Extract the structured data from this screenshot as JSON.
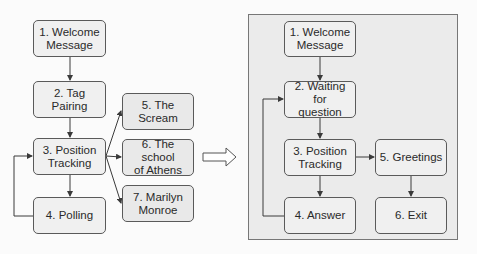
{
  "left_diagram": {
    "nodes": [
      {
        "id": "1",
        "label": "1. Welcome\nMessage"
      },
      {
        "id": "2",
        "label": "2. Tag Pairing"
      },
      {
        "id": "3",
        "label": "3. Position\nTracking"
      },
      {
        "id": "4",
        "label": "4. Polling"
      },
      {
        "id": "5",
        "label": "5. The\nScream"
      },
      {
        "id": "6",
        "label": "6. The school\nof Athens"
      },
      {
        "id": "7",
        "label": "7. Marilyn\nMonroe"
      }
    ],
    "edges": [
      {
        "from": "1",
        "to": "2"
      },
      {
        "from": "2",
        "to": "3"
      },
      {
        "from": "3",
        "to": "4"
      },
      {
        "from": "4",
        "to": "3"
      },
      {
        "from": "3",
        "to": "5"
      },
      {
        "from": "3",
        "to": "6"
      },
      {
        "from": "3",
        "to": "7"
      }
    ]
  },
  "transition_arrow": "hollow-right-arrow",
  "right_diagram": {
    "nodes": [
      {
        "id": "1",
        "label": "1. Welcome\nMessage"
      },
      {
        "id": "2",
        "label": "2. Waiting for\nquestion"
      },
      {
        "id": "3",
        "label": "3. Position\nTracking"
      },
      {
        "id": "4",
        "label": "4. Answer"
      },
      {
        "id": "5",
        "label": "5. Greetings"
      },
      {
        "id": "6",
        "label": "6. Exit"
      }
    ],
    "edges": [
      {
        "from": "1",
        "to": "2"
      },
      {
        "from": "2",
        "to": "3"
      },
      {
        "from": "3",
        "to": "4"
      },
      {
        "from": "4",
        "to": "2"
      },
      {
        "from": "3",
        "to": "5"
      },
      {
        "from": "5",
        "to": "6"
      }
    ]
  },
  "colors": {
    "box_fill": "#f0f0f0",
    "box_border": "#5a5a5a",
    "panel_fill": "#ebebeb",
    "panel_border": "#777777",
    "line": "#3a3a3a"
  }
}
